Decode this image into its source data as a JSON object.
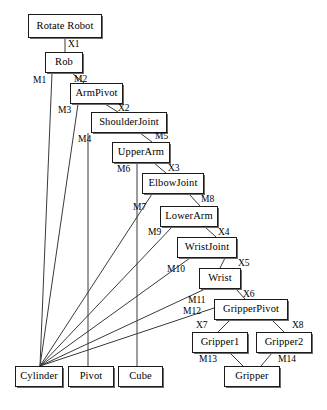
{
  "diagram": {
    "type": "node-link-diagram",
    "background_color": "#ffffff",
    "node_border_color": "#1a1a1a",
    "edge_color": "#3a3a3a",
    "text_color": "#000000",
    "nodes": [
      {
        "id": "rotate-robot",
        "label": "Rotate Robot",
        "x": 28,
        "y": 14,
        "w": 74,
        "h": 24
      },
      {
        "id": "rob",
        "label": "Rob",
        "x": 45,
        "y": 52,
        "w": 38,
        "h": 21
      },
      {
        "id": "armpivot",
        "label": "ArmPivot",
        "x": 70,
        "y": 83,
        "w": 53,
        "h": 21
      },
      {
        "id": "shoulderjoint",
        "label": "ShoulderJoint",
        "x": 91,
        "y": 112,
        "w": 76,
        "h": 21
      },
      {
        "id": "upperarm",
        "label": "UpperArm",
        "x": 112,
        "y": 142,
        "w": 58,
        "h": 21
      },
      {
        "id": "elbowjoint",
        "label": "ElbowJoint",
        "x": 142,
        "y": 173,
        "w": 62,
        "h": 21
      },
      {
        "id": "lowerarm",
        "label": "LowerArm",
        "x": 160,
        "y": 206,
        "w": 58,
        "h": 21
      },
      {
        "id": "wristjoint",
        "label": "WristJoint",
        "x": 177,
        "y": 237,
        "w": 60,
        "h": 21
      },
      {
        "id": "wrist",
        "label": "Wrist",
        "x": 199,
        "y": 268,
        "w": 42,
        "h": 21
      },
      {
        "id": "gripperpivot",
        "label": "GripperPivot",
        "x": 214,
        "y": 299,
        "w": 74,
        "h": 21
      },
      {
        "id": "gripper1",
        "label": "Gripper1",
        "x": 192,
        "y": 332,
        "w": 56,
        "h": 21
      },
      {
        "id": "gripper2",
        "label": "Gripper2",
        "x": 256,
        "y": 332,
        "w": 56,
        "h": 21
      },
      {
        "id": "gripper",
        "label": "Gripper",
        "x": 224,
        "y": 366,
        "w": 56,
        "h": 21
      },
      {
        "id": "cylinder",
        "label": "Cylinder",
        "x": 15,
        "y": 366,
        "w": 48,
        "h": 21
      },
      {
        "id": "pivot",
        "label": "Pivot",
        "x": 68,
        "y": 366,
        "w": 46,
        "h": 21
      },
      {
        "id": "cube",
        "label": "Cube",
        "x": 118,
        "y": 366,
        "w": 45,
        "h": 21
      }
    ],
    "edges": [
      {
        "id": "e-x1",
        "label": "X1",
        "from": "rotate-robot",
        "to": "rob",
        "x1": 65,
        "y1": 38,
        "x2": 65,
        "y2": 52,
        "lx": 68,
        "ly": 40
      },
      {
        "id": "e-m1",
        "label": "M1",
        "from": "rob",
        "to": "cylinder",
        "x1": 52,
        "y1": 73,
        "x2": 40,
        "y2": 366,
        "lx": 33,
        "ly": 76
      },
      {
        "id": "e-m2",
        "label": "M2",
        "from": "rob",
        "to": "armpivot",
        "x1": 72,
        "y1": 73,
        "x2": 84,
        "y2": 83,
        "lx": 74,
        "ly": 75
      },
      {
        "id": "e-x2",
        "label": "X2",
        "from": "armpivot",
        "to": "shoulderjoint",
        "x1": 105,
        "y1": 104,
        "x2": 118,
        "y2": 112,
        "lx": 118,
        "ly": 104
      },
      {
        "id": "e-m3",
        "label": "M3",
        "from": "armpivot",
        "to": "cylinder",
        "x1": 78,
        "y1": 104,
        "x2": 40,
        "y2": 366,
        "lx": 58,
        "ly": 106
      },
      {
        "id": "e-x3",
        "label": "X3",
        "from": "upperarm",
        "to": "elbowjoint",
        "x1": 154,
        "y1": 163,
        "x2": 166,
        "y2": 173,
        "lx": 168,
        "ly": 164
      },
      {
        "id": "e-m4",
        "label": "M4",
        "from": "shoulderjoint",
        "to": "pivot",
        "x1": 88,
        "y1": 133,
        "x2": 88,
        "y2": 366,
        "lx": 78,
        "ly": 135
      },
      {
        "id": "e-m5",
        "label": "M5",
        "from": "shoulderjoint",
        "to": "upperarm",
        "x1": 140,
        "y1": 133,
        "x2": 152,
        "y2": 142,
        "lx": 155,
        "ly": 132
      },
      {
        "id": "e-m6",
        "label": "M6",
        "from": "upperarm",
        "to": "cube",
        "x1": 137,
        "y1": 163,
        "x2": 137,
        "y2": 366,
        "lx": 117,
        "ly": 165
      },
      {
        "id": "e-m7",
        "label": "M7",
        "from": "elbowjoint",
        "to": "cylinder",
        "x1": 152,
        "y1": 194,
        "x2": 40,
        "y2": 366,
        "lx": 133,
        "ly": 203
      },
      {
        "id": "e-m8",
        "label": "M8",
        "from": "elbowjoint",
        "to": "lowerarm",
        "x1": 189,
        "y1": 194,
        "x2": 200,
        "y2": 206,
        "lx": 201,
        "ly": 195
      },
      {
        "id": "e-x4",
        "label": "X4",
        "from": "lowerarm",
        "to": "wristjoint",
        "x1": 205,
        "y1": 227,
        "x2": 216,
        "y2": 237,
        "lx": 218,
        "ly": 228
      },
      {
        "id": "e-m9",
        "label": "M9",
        "from": "lowerarm",
        "to": "cylinder",
        "x1": 172,
        "y1": 227,
        "x2": 40,
        "y2": 366,
        "lx": 148,
        "ly": 228
      },
      {
        "id": "e-x5",
        "label": "X5",
        "from": "wristjoint",
        "to": "wrist",
        "x1": 225,
        "y1": 258,
        "x2": 220,
        "y2": 268,
        "lx": 238,
        "ly": 259
      },
      {
        "id": "e-m10",
        "label": "M10",
        "from": "wristjoint",
        "to": "cylinder",
        "x1": 190,
        "y1": 258,
        "x2": 40,
        "y2": 366,
        "lx": 167,
        "ly": 265
      },
      {
        "id": "e-x6",
        "label": "X6",
        "from": "wrist",
        "to": "gripperpivot",
        "x1": 236,
        "y1": 289,
        "x2": 245,
        "y2": 299,
        "lx": 243,
        "ly": 290
      },
      {
        "id": "e-m11",
        "label": "M11",
        "from": "wrist",
        "to": "cylinder",
        "x1": 205,
        "y1": 289,
        "x2": 40,
        "y2": 366,
        "lx": 188,
        "ly": 296
      },
      {
        "id": "e-m12",
        "label": "M12",
        "from": "gripperpivot",
        "to": "cylinder",
        "x1": 214,
        "y1": 308,
        "x2": 40,
        "y2": 366,
        "lx": 183,
        "ly": 307
      },
      {
        "id": "e-x7",
        "label": "X7",
        "from": "gripperpivot",
        "to": "gripper1",
        "x1": 230,
        "y1": 320,
        "x2": 218,
        "y2": 332,
        "lx": 196,
        "ly": 321
      },
      {
        "id": "e-x8",
        "label": "X8",
        "from": "gripperpivot",
        "to": "gripper2",
        "x1": 272,
        "y1": 320,
        "x2": 284,
        "y2": 332,
        "lx": 292,
        "ly": 321
      },
      {
        "id": "e-m13",
        "label": "M13",
        "from": "gripper1",
        "to": "gripper",
        "x1": 230,
        "y1": 353,
        "x2": 243,
        "y2": 366,
        "lx": 199,
        "ly": 355
      },
      {
        "id": "e-m14",
        "label": "M14",
        "from": "gripper2",
        "to": "gripper",
        "x1": 272,
        "y1": 353,
        "x2": 261,
        "y2": 366,
        "lx": 278,
        "ly": 355
      }
    ]
  }
}
